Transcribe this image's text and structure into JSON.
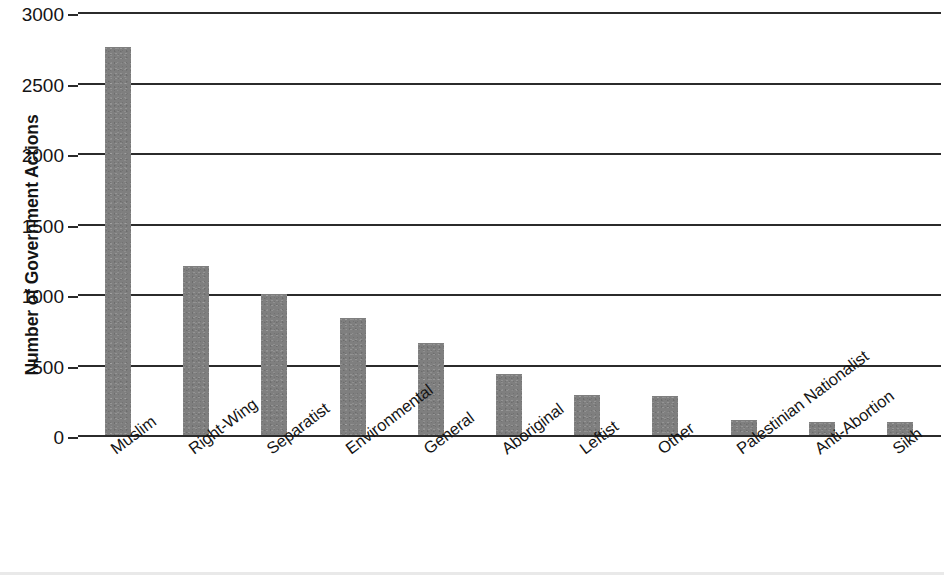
{
  "chart_data": {
    "type": "bar",
    "title": "",
    "subtitle": "",
    "xlabel": "",
    "ylabel": "Number of Government Actions",
    "categories": [
      "Muslim",
      "Right-Wing",
      "Separatist",
      "Environmental",
      "General",
      "Aboriginal",
      "Leftist",
      "Other",
      "Palestinian Nationalist",
      "Anti-Abortion",
      "Sikh"
    ],
    "values": [
      2750,
      1200,
      1000,
      830,
      650,
      430,
      285,
      280,
      110,
      90,
      90
    ],
    "ylim": [
      0,
      3000
    ],
    "yticks": [
      0,
      500,
      1000,
      1500,
      2000,
      2500,
      3000
    ],
    "ytick_labels": [
      "0",
      "500",
      "1000",
      "1500",
      "2000",
      "2500",
      "3000"
    ],
    "grid": true,
    "grid_axis": "y",
    "legend": false,
    "legend_position": "none",
    "bar_color": "#7f7f7f",
    "axis_color": "#2b2b2b",
    "background_color": "#ffffff",
    "xtick_label_rotation": -37
  }
}
